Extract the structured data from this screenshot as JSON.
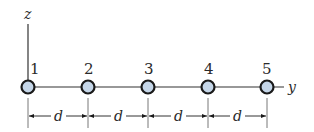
{
  "diagram": {
    "axes": {
      "vertical_label": "z",
      "horizontal_label": "y"
    },
    "nodes": [
      {
        "label": "1",
        "x": 28
      },
      {
        "label": "2",
        "x": 88
      },
      {
        "label": "3",
        "x": 148
      },
      {
        "label": "4",
        "x": 208
      },
      {
        "label": "5",
        "x": 267
      }
    ],
    "spacing_labels": [
      "d",
      "d",
      "d",
      "d"
    ],
    "colors": {
      "node_fill": "#c5d6e8",
      "node_stroke": "#1a1a1a",
      "line": "#333333"
    }
  }
}
